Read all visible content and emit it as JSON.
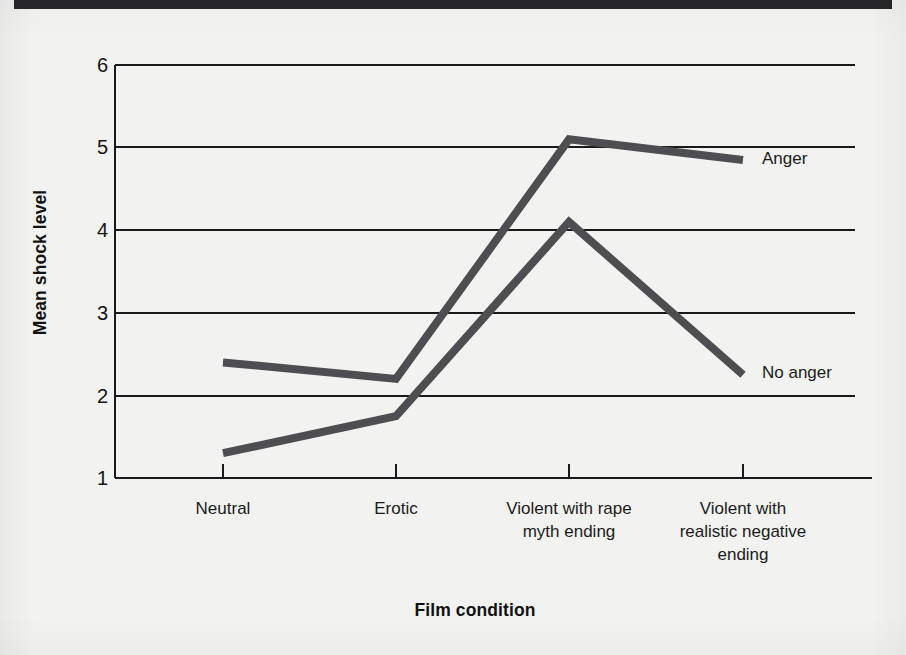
{
  "figure": {
    "background_color": "#f2f2f0",
    "top_rule_color": "#27272a",
    "line_color": "#4e4e52",
    "axis_color": "#1a1a1a"
  },
  "chart_data": {
    "type": "line",
    "title": "",
    "xlabel": "Film condition",
    "ylabel": "Mean shock level",
    "categories": [
      "Neutral",
      "Erotic",
      "Violent with rape myth ending",
      "Violent with realistic negative ending"
    ],
    "category_lines": [
      [
        "Neutral"
      ],
      [
        "Erotic"
      ],
      [
        "Violent with rape",
        "myth ending"
      ],
      [
        "Violent with",
        "realistic negative",
        "ending"
      ]
    ],
    "series": [
      {
        "name": "Anger",
        "values": [
          2.4,
          2.2,
          5.1,
          4.85
        ],
        "color": "#4e4e52"
      },
      {
        "name": "No anger",
        "values": [
          1.3,
          1.75,
          4.1,
          2.25
        ],
        "color": "#4e4e52"
      }
    ],
    "ylim": [
      1,
      6
    ],
    "yticks": [
      1,
      2,
      3,
      4,
      5,
      6
    ],
    "ytick_labels": [
      "1",
      "2",
      "3",
      "4",
      "5",
      "6"
    ],
    "grid": true,
    "grid_axis": "y",
    "legend": "inline-end-of-line",
    "legend_labels": [
      "Anger",
      "No anger"
    ]
  }
}
